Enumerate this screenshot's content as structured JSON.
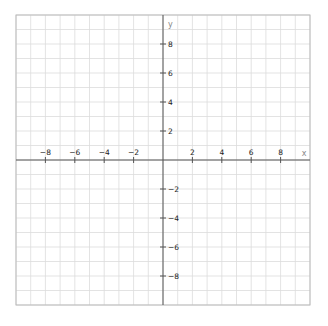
{
  "chart_data": {
    "type": "scatter",
    "title": "",
    "xlabel": "x",
    "ylabel": "y",
    "xlim": [
      -10,
      10
    ],
    "ylim": [
      -10,
      10
    ],
    "grid": true,
    "grid_step": 1,
    "x_ticks": [
      -8,
      -6,
      -4,
      -2,
      2,
      4,
      6,
      8
    ],
    "y_ticks": [
      8,
      6,
      4,
      2,
      -2,
      -4,
      -6,
      -8
    ],
    "x_tick_labels": [
      "−8",
      "−6",
      "−4",
      "−2",
      "2",
      "4",
      "6",
      "8"
    ],
    "y_tick_labels": [
      "8",
      "6",
      "4",
      "2",
      "−2",
      "−4",
      "−6",
      "−8"
    ],
    "series": [],
    "legend": null
  },
  "colors": {
    "grid": "#dcdcdc",
    "axis": "#555555",
    "frame": "#bbbbbb",
    "label": "#222222",
    "axis_name": "#888888"
  }
}
